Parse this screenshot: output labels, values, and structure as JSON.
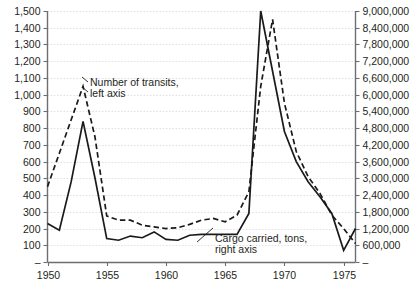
{
  "chart_data": {
    "type": "line",
    "title": "",
    "subtitle": "",
    "xlabel": "",
    "ylabel": "",
    "grid": true,
    "legend_position": "inline-annotation",
    "x": [
      1950,
      1951,
      1952,
      1953,
      1954,
      1955,
      1956,
      1957,
      1958,
      1959,
      1960,
      1961,
      1962,
      1963,
      1964,
      1965,
      1966,
      1967,
      1968,
      1969,
      1970,
      1971,
      1972,
      1973,
      1974,
      1975,
      1976
    ],
    "x_axis": {
      "ticks": [
        1950,
        1955,
        1960,
        1965,
        1970,
        1975
      ],
      "tick_labels": [
        "1950",
        "1955",
        "1960",
        "1965",
        "1970",
        "1975"
      ],
      "range": [
        1950,
        1976
      ]
    },
    "y_axis_left": {
      "label": "Number of transits, left axis",
      "ticks": [
        0,
        100,
        200,
        300,
        400,
        500,
        600,
        700,
        800,
        900,
        1000,
        1100,
        1200,
        1300,
        1400,
        1500
      ],
      "tick_labels": [
        "–",
        "100",
        "200",
        "300",
        "400",
        "500",
        "600",
        "700",
        "800",
        "900",
        "1,000",
        "1,100",
        "1,200",
        "1,300",
        "1,400",
        "1,500"
      ],
      "range": [
        0,
        1500
      ]
    },
    "y_axis_right": {
      "label": "Cargo carried, tons, right axis",
      "ticks": [
        0,
        600000,
        1200000,
        1800000,
        2400000,
        3000000,
        3600000,
        4200000,
        4800000,
        5400000,
        6000000,
        6600000,
        7200000,
        7800000,
        8400000,
        9000000
      ],
      "tick_labels": [
        "–",
        "600,000",
        "1,200,000",
        "1,800,000",
        "2,400,000",
        "3,000,000",
        "3,600,000",
        "4,200,000",
        "4,800,000",
        "5,400,000",
        "6,000,000",
        "6,600,000",
        "7,200,000",
        "7,800,000",
        "8,400,000",
        "9,000,000"
      ],
      "range": [
        0,
        9000000
      ]
    },
    "series": [
      {
        "name": "Number of transits, left axis",
        "axis": "left",
        "style": "solid",
        "values": [
          230,
          190,
          480,
          840,
          505,
          140,
          130,
          155,
          145,
          180,
          135,
          130,
          160,
          165,
          165,
          165,
          165,
          290,
          1500,
          1140,
          780,
          600,
          480,
          390,
          290,
          70,
          200
        ]
      },
      {
        "name": "Cargo carried, tons, right axis",
        "axis": "right",
        "style": "dashed",
        "values": [
          2700000,
          3900000,
          5100000,
          6300000,
          4500000,
          1650000,
          1500000,
          1500000,
          1320000,
          1260000,
          1200000,
          1230000,
          1350000,
          1500000,
          1560000,
          1440000,
          1680000,
          2520000,
          6300000,
          8700000,
          5700000,
          3960000,
          3060000,
          2460000,
          1680000,
          1200000,
          660000
        ]
      }
    ],
    "annotations": [
      {
        "id": "transits-annotation",
        "line1": "Number of transits,",
        "line2": "left axis"
      },
      {
        "id": "cargo-annotation",
        "line1": "Cargo carried, tons,",
        "line2": "right axis"
      }
    ],
    "colors": {
      "line": "#1a1a1a",
      "grid": "#d6d3d6",
      "axis": "#6d6e71",
      "text": "#231f20",
      "background": "#ffffff"
    }
  }
}
